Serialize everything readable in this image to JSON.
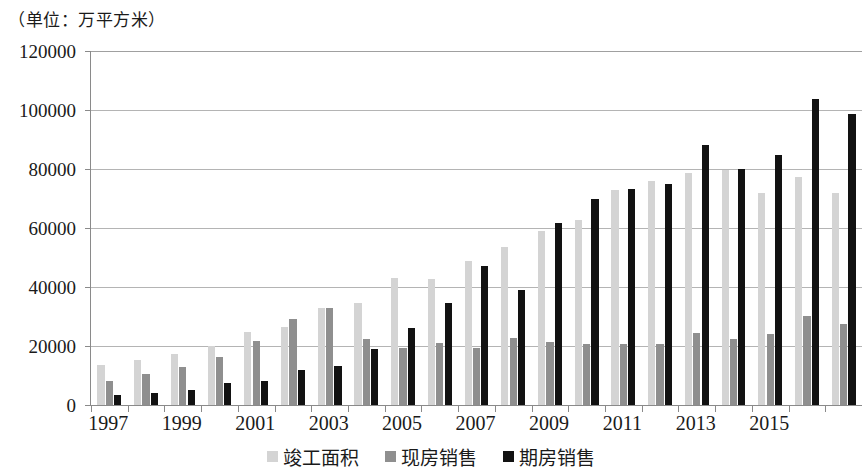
{
  "caption": "（单位：万平方米）",
  "chart_data": {
    "type": "bar",
    "title": "",
    "subtitle": "",
    "unit_note": "（单位：万平方米）",
    "xlabel": "",
    "ylabel": "",
    "ylim": [
      0,
      120000
    ],
    "ytick_step": 20000,
    "yticks": [
      "0",
      "20000",
      "40000",
      "60000",
      "80000",
      "100000",
      "120000"
    ],
    "grid": true,
    "legend_position": "bottom",
    "categories": [
      "1997",
      "1998",
      "1999",
      "2000",
      "2001",
      "2002",
      "2003",
      "2004",
      "2005",
      "2006",
      "2007",
      "2008",
      "2009",
      "2010",
      "2011",
      "2012",
      "2013",
      "2014",
      "2015",
      "2016",
      "2017"
    ],
    "xtick_labels_shown": [
      "1997",
      "1999",
      "2001",
      "2003",
      "2005",
      "2007",
      "2009",
      "2011",
      "2013",
      "2015"
    ],
    "series": [
      {
        "name": "竣工面积",
        "color": "#d4d4d4",
        "values": [
          13500,
          15400,
          17400,
          19900,
          24600,
          26500,
          33000,
          34600,
          43000,
          42700,
          48800,
          53700,
          59100,
          62700,
          73000,
          75800,
          78700,
          79500,
          72000,
          77200,
          71800
        ]
      },
      {
        "name": "现房销售",
        "color": "#8f8f8f",
        "values": [
          8100,
          10600,
          12800,
          16300,
          21600,
          29000,
          33000,
          22400,
          19300,
          21000,
          19200,
          22700,
          21200,
          20600,
          20700,
          20600,
          24300,
          22400,
          24100,
          30300,
          27600
        ]
      },
      {
        "name": "期房销售",
        "color": "#121212",
        "values": [
          3500,
          4200,
          5000,
          7600,
          8200,
          11800,
          13200,
          19000,
          26000,
          34500,
          47200,
          39000,
          61600,
          70000,
          73200,
          75000,
          88200,
          80000,
          84700,
          103900,
          98700
        ]
      }
    ]
  },
  "legend": {
    "items": [
      {
        "label": "竣工面积",
        "color": "#d4d4d4"
      },
      {
        "label": "现房销售",
        "color": "#8f8f8f"
      },
      {
        "label": "期房销售",
        "color": "#121212"
      }
    ]
  }
}
